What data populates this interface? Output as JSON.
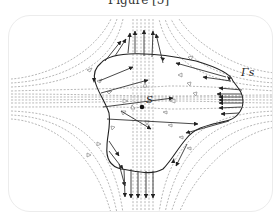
{
  "caption": "Figure [5]",
  "labels": {
    "saddle_point": "S",
    "boundary_curve": "Γs"
  },
  "colors": {
    "stream_lines": "#9a9a9a",
    "vectors": "#333333",
    "curve": "#222222",
    "border": "#ececec"
  }
}
